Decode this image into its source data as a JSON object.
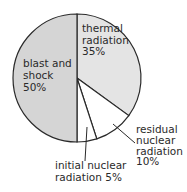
{
  "chart_data": {
    "type": "pie",
    "title": "",
    "start": "top",
    "direction": "clockwise",
    "slices": [
      {
        "name": "thermal radiation",
        "value": 35,
        "label_lines": [
          "thermal",
          "radiation",
          "35%"
        ],
        "color": "#e4e4e4",
        "label_position": "inside"
      },
      {
        "name": "residual nuclear radiation",
        "value": 10,
        "label_lines": [
          "residual",
          "nuclear",
          "radiation",
          "10%"
        ],
        "color": "#ffffff",
        "label_position": "outside-bottom-right"
      },
      {
        "name": "initial nuclear radiation",
        "value": 5,
        "label_lines": [
          "initial nuclear",
          "radiation 5%"
        ],
        "color": "#ffffff",
        "label_position": "outside-bottom"
      },
      {
        "name": "blast and shock",
        "value": 50,
        "label_lines": [
          "blast and",
          "shock",
          "50%"
        ],
        "color": "#d5d5d5",
        "label_position": "inside"
      }
    ],
    "outline_color": "#2a2a2a"
  }
}
